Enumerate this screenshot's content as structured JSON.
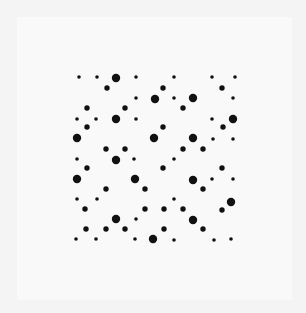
{
  "canvas": {
    "width": 306,
    "height": 313,
    "background": "#f4f4f4"
  },
  "panel": {
    "x": 17,
    "y": 17,
    "width": 275,
    "height": 283,
    "color": "#f9f9f9"
  },
  "dot_style": {
    "color": "#111111",
    "radii": {
      "s": 1.8,
      "m": 2.7,
      "l": 4.2
    }
  },
  "dots": [
    [
      79,
      77,
      "s"
    ],
    [
      97,
      77,
      "s"
    ],
    [
      116,
      78,
      "l"
    ],
    [
      136,
      77,
      "s"
    ],
    [
      174,
      77,
      "s"
    ],
    [
      212,
      77,
      "s"
    ],
    [
      235,
      77,
      "s"
    ],
    [
      107,
      88,
      "m"
    ],
    [
      163,
      88,
      "m"
    ],
    [
      222,
      88,
      "m"
    ],
    [
      136,
      98,
      "s"
    ],
    [
      155,
      99,
      "l"
    ],
    [
      174,
      98,
      "s"
    ],
    [
      193,
      98,
      "l"
    ],
    [
      233,
      98,
      "s"
    ],
    [
      87,
      108,
      "m"
    ],
    [
      125,
      108,
      "m"
    ],
    [
      183,
      108,
      "m"
    ],
    [
      77,
      119,
      "s"
    ],
    [
      96,
      119,
      "s"
    ],
    [
      116,
      119,
      "l"
    ],
    [
      136,
      119,
      "s"
    ],
    [
      212,
      119,
      "s"
    ],
    [
      233,
      119,
      "l"
    ],
    [
      87,
      127,
      "m"
    ],
    [
      163,
      127,
      "m"
    ],
    [
      223,
      127,
      "m"
    ],
    [
      77,
      138,
      "l"
    ],
    [
      154,
      138,
      "l"
    ],
    [
      193,
      138,
      "l"
    ],
    [
      213,
      139,
      "s"
    ],
    [
      233,
      139,
      "s"
    ],
    [
      106,
      149,
      "m"
    ],
    [
      125,
      149,
      "m"
    ],
    [
      183,
      149,
      "m"
    ],
    [
      203,
      149,
      "m"
    ],
    [
      77,
      159,
      "s"
    ],
    [
      116,
      160,
      "l"
    ],
    [
      134,
      159,
      "s"
    ],
    [
      174,
      159,
      "s"
    ],
    [
      87,
      168,
      "m"
    ],
    [
      163,
      168,
      "m"
    ],
    [
      222,
      168,
      "m"
    ],
    [
      77,
      179,
      "l"
    ],
    [
      135,
      179,
      "l"
    ],
    [
      193,
      180,
      "l"
    ],
    [
      212,
      179,
      "s"
    ],
    [
      233,
      179,
      "s"
    ],
    [
      106,
      189,
      "m"
    ],
    [
      145,
      189,
      "m"
    ],
    [
      203,
      189,
      "m"
    ],
    [
      77,
      199,
      "s"
    ],
    [
      97,
      199,
      "s"
    ],
    [
      174,
      199,
      "s"
    ],
    [
      231,
      202,
      "l"
    ],
    [
      85,
      209,
      "m"
    ],
    [
      145,
      209,
      "m"
    ],
    [
      164,
      209,
      "m"
    ],
    [
      183,
      209,
      "m"
    ],
    [
      222,
      210,
      "m"
    ],
    [
      116,
      219,
      "l"
    ],
    [
      136,
      219,
      "s"
    ],
    [
      193,
      220,
      "l"
    ],
    [
      86,
      229,
      "m"
    ],
    [
      106,
      229,
      "m"
    ],
    [
      125,
      229,
      "m"
    ],
    [
      164,
      229,
      "m"
    ],
    [
      203,
      229,
      "m"
    ],
    [
      76,
      239,
      "s"
    ],
    [
      96,
      239,
      "s"
    ],
    [
      135,
      239,
      "s"
    ],
    [
      153,
      239,
      "l"
    ],
    [
      174,
      240,
      "s"
    ],
    [
      214,
      240,
      "s"
    ],
    [
      231,
      239,
      "s"
    ]
  ]
}
